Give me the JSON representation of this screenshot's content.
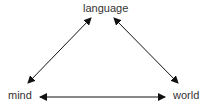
{
  "diagram": {
    "nodes": [
      {
        "id": "language",
        "label": "language"
      },
      {
        "id": "mind",
        "label": "mind"
      },
      {
        "id": "world",
        "label": "world"
      }
    ],
    "edges": [
      {
        "from": "language",
        "to": "mind",
        "direction": "bidirectional"
      },
      {
        "from": "language",
        "to": "world",
        "direction": "bidirectional"
      },
      {
        "from": "mind",
        "to": "world",
        "direction": "bidirectional"
      }
    ],
    "colors": {
      "line": "#111111",
      "text": "#333333"
    }
  }
}
